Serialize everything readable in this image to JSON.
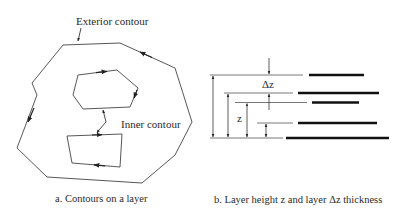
{
  "figure_a": {
    "caption": "a. Contours on a layer",
    "exterior_label": "Exterior contour",
    "inner_label": "Inner contour"
  },
  "figure_b": {
    "caption": "b. Layer height z and layer Δz thickness",
    "delta_z_label": "Δz",
    "z_label": "z"
  },
  "colors": {
    "line": "#444444",
    "bar": "#111111",
    "text": "#2a2a2a",
    "background": "#ffffff"
  }
}
